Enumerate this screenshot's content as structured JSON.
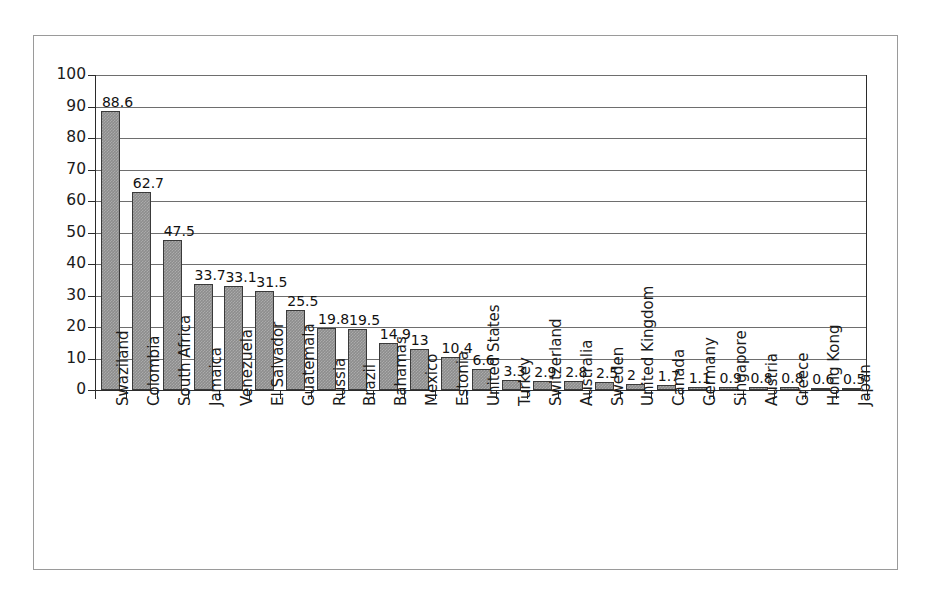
{
  "chart_data": {
    "type": "bar",
    "title": "",
    "subtitle": "",
    "xlabel": "",
    "ylabel": "",
    "ylim": [
      0,
      100
    ],
    "yticks": [
      0,
      10,
      20,
      30,
      40,
      50,
      60,
      70,
      80,
      90,
      100
    ],
    "grid": true,
    "legend": false,
    "orientation": "vertical",
    "categories": [
      "Swaziland",
      "Colombia",
      "South Africa",
      "Jamaica",
      "Venezuela",
      "El Salvador",
      "Guatemala",
      "Russia",
      "Brazil",
      "Bahamas",
      "Mexico",
      "Estonia",
      "United States",
      "Turkey",
      "Switzerland",
      "Australia",
      "Sweden",
      "United Kingdom",
      "Canada",
      "Germany",
      "Singapore",
      "Austria",
      "Greece",
      "Hong Kong",
      "Japan"
    ],
    "values": [
      88.6,
      62.7,
      47.5,
      33.7,
      33.1,
      31.5,
      25.5,
      19.8,
      19.5,
      14.9,
      13,
      10.4,
      6.6,
      3.3,
      2.9,
      2.8,
      2.5,
      2,
      1.7,
      1.1,
      0.9,
      0.8,
      0.8,
      0.6,
      0.5
    ],
    "value_labels": [
      "88.6",
      "62.7",
      "47.5",
      "33.7",
      "33.1",
      "31.5",
      "25.5",
      "19.8",
      "19.5",
      "14.9",
      "13",
      "10.4",
      "6.6",
      "3.3",
      "2.9",
      "2.8",
      "2.5",
      "2",
      "1.7",
      "1.1",
      "0.9",
      "0.8",
      "0.8",
      "0.6",
      "0.5"
    ],
    "ytick_labels": [
      "0",
      "10",
      "20",
      "30",
      "40",
      "50",
      "60",
      "70",
      "80",
      "90",
      "100"
    ],
    "colors": {
      "bar_fill": "#8d8d8d",
      "bar_border": "#3a3a3a",
      "gridline": "#6e6e6e",
      "axis": "#2b2b2b",
      "frame": "#9a9a9a",
      "background": "#ffffff",
      "text": "#1b1b1b"
    }
  }
}
